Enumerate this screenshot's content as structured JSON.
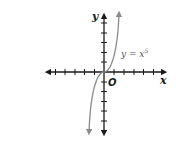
{
  "figure": {
    "x_axis_label": "x",
    "y_axis_label": "y",
    "origin_label": "O",
    "curve_label_prefix": "y = x",
    "curve_label_exponent": "5",
    "x_ticks_left": 5,
    "x_ticks_right": 5,
    "y_ticks_up": 5,
    "y_ticks_down": 5
  },
  "colors": {
    "axes": "#1a1a1a",
    "curve": "#8a8a8a",
    "background": "#ffffff"
  }
}
